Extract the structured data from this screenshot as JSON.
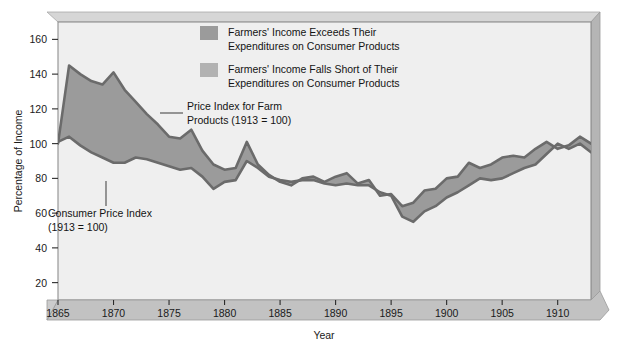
{
  "chart_data": {
    "type": "area",
    "title": "",
    "xlabel": "Year",
    "ylabel": "Percentage of Income",
    "xlim": [
      1865,
      1913
    ],
    "ylim": [
      10,
      170
    ],
    "ytick_labels": [
      "20",
      "40",
      "60",
      "80",
      "100",
      "120",
      "140",
      "160"
    ],
    "ytick_values": [
      20,
      40,
      60,
      80,
      100,
      120,
      140,
      160
    ],
    "xtick_labels": [
      "1865",
      "1870",
      "1875",
      "1880",
      "1885",
      "1890",
      "1895",
      "1900",
      "1905",
      "1910"
    ],
    "xtick_values": [
      1865,
      1870,
      1875,
      1880,
      1885,
      1890,
      1895,
      1900,
      1905,
      1910
    ],
    "grid": false,
    "legend_position": "upper-center",
    "x": [
      1865,
      1866,
      1867,
      1868,
      1869,
      1870,
      1871,
      1872,
      1873,
      1874,
      1875,
      1876,
      1877,
      1878,
      1879,
      1880,
      1881,
      1882,
      1883,
      1884,
      1885,
      1886,
      1887,
      1888,
      1889,
      1890,
      1891,
      1892,
      1893,
      1894,
      1895,
      1896,
      1897,
      1898,
      1899,
      1900,
      1901,
      1902,
      1903,
      1904,
      1905,
      1906,
      1907,
      1908,
      1909,
      1910,
      1911,
      1912,
      1913
    ],
    "series": [
      {
        "name": "Price Index for Farm Products (1913 = 100)",
        "color": "#6b6b6b",
        "values": [
          100,
          145,
          140,
          136,
          134,
          141,
          131,
          124,
          117,
          111,
          104,
          103,
          108,
          96,
          88,
          85,
          86,
          101,
          88,
          82,
          78,
          76,
          80,
          81,
          78,
          81,
          83,
          77,
          79,
          70,
          71,
          64,
          66,
          73,
          74,
          80,
          81,
          89,
          86,
          88,
          92,
          93,
          92,
          97,
          101,
          97,
          99,
          104,
          100
        ]
      },
      {
        "name": "Consumer Price Index (1913 = 100)",
        "color": "#6b6b6b",
        "values": [
          101,
          104,
          99,
          95,
          92,
          89,
          89,
          92,
          91,
          89,
          87,
          85,
          86,
          81,
          74,
          78,
          79,
          90,
          86,
          81,
          79,
          78,
          79,
          79,
          77,
          76,
          77,
          76,
          76,
          72,
          70,
          58,
          55,
          61,
          64,
          69,
          72,
          76,
          80,
          79,
          80,
          83,
          86,
          88,
          94,
          100,
          97,
          100,
          95
        ]
      }
    ],
    "annotations": [
      {
        "id": "farm-label",
        "text_line1": "Price Index for Farm",
        "text_line2": "Products (1913 = 100)"
      },
      {
        "id": "cpi-label",
        "text_line1": "Consumer Price Index",
        "text_line2": "(1913 = 100)"
      }
    ]
  },
  "legend": {
    "items": [
      {
        "swatch_color": "#999999",
        "line1": "Farmers' Income Exceeds Their",
        "line2": "Expenditures on Consumer Products"
      },
      {
        "swatch_color": "#b0b0b0",
        "line1": "Farmers' Income Falls Short of Their",
        "line2": "Expenditures on Consumer Products"
      }
    ]
  },
  "colors": {
    "plot_background": "#efefef",
    "frame_top": "#cfcfcf",
    "frame_side": "#b8b8b8",
    "axis_band": "#bdbdbd",
    "line": "#6b6b6b",
    "fill_above": "#999999",
    "fill_below": "#b0b0b0",
    "text": "#141414"
  }
}
